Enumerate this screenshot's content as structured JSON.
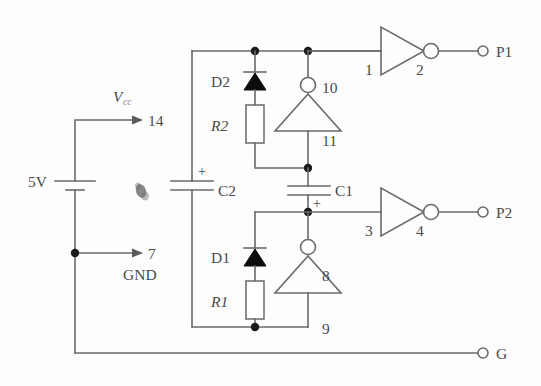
{
  "figure": {
    "kind": "circuit-schematic",
    "title": "",
    "background_color": "#fdfdfd",
    "line_color": "#6a6a6a",
    "text_color": "#4a4a4a"
  },
  "power": {
    "source_label": "5V",
    "vcc_label": "V",
    "vcc_subscript": "cc",
    "vcc_pin": "14",
    "gnd_pin": "7",
    "gnd_label": "GND"
  },
  "components": {
    "capacitors": [
      {
        "ref": "C2",
        "polarity_mark": "+"
      },
      {
        "ref": "C1",
        "polarity_mark": "+"
      }
    ],
    "resistors": [
      {
        "ref": "R2"
      },
      {
        "ref": "R1"
      }
    ],
    "diodes": [
      {
        "ref": "D2"
      },
      {
        "ref": "D1"
      }
    ],
    "inverters": [
      {
        "name": "inverter-p1",
        "input_pin": "1",
        "output_pin": "2"
      },
      {
        "name": "inverter-upper-osc",
        "output_pin": "10",
        "input_pin": "11"
      },
      {
        "name": "inverter-p2",
        "input_pin": "3",
        "output_pin": "4"
      },
      {
        "name": "inverter-lower-osc",
        "output_pin": "8",
        "input_pin": "9"
      }
    ]
  },
  "terminals": [
    {
      "name": "terminal-p1",
      "label": "P1"
    },
    {
      "name": "terminal-p2",
      "label": "P2"
    },
    {
      "name": "terminal-g",
      "label": "G"
    }
  ]
}
